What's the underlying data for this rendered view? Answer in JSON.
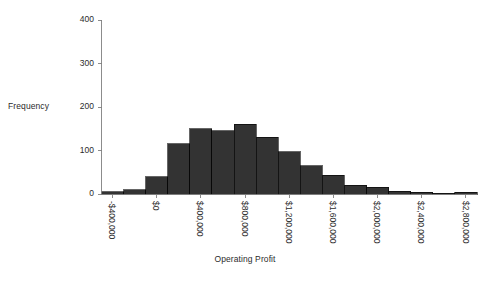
{
  "chart_data": {
    "type": "bar",
    "title": "",
    "xlabel": "Operating Profit",
    "ylabel": "Frequency",
    "bin_width": 200000,
    "x_start": -500000,
    "xlim": [
      -500000,
      2900000
    ],
    "ylim": [
      0,
      400
    ],
    "grid": false,
    "legend": null,
    "bar_color": "#333333",
    "axis_color": "#808080",
    "categories": [
      "-$500,000 to -$300,000",
      "-$300,000 to -$100,000",
      "-$100,000 to $100,000",
      "$100,000 to $300,000",
      "$300,000 to $500,000",
      "$500,000 to $700,000",
      "$700,000 to $900,000",
      "$900,000 to $1,100,000",
      "$1,100,000 to $1,300,000",
      "$1,300,000 to $1,500,000",
      "$1,500,000 to $1,700,000",
      "$1,700,000 to $1,900,000",
      "$1,900,000 to $2,100,000",
      "$2,100,000 to $2,300,000",
      "$2,300,000 to $2,500,000",
      "$2,500,000 to $2,700,000",
      "$2,700,000 to $2,900,000"
    ],
    "values": [
      5,
      10,
      40,
      115,
      150,
      145,
      160,
      130,
      97,
      65,
      43,
      20,
      15,
      6,
      4,
      2,
      4
    ],
    "ytick_labels": [
      "0",
      "100",
      "200",
      "300",
      "400"
    ],
    "ytick_values": [
      0,
      100,
      200,
      300,
      400
    ],
    "xtick_labels": [
      "-$400,000",
      "$0",
      "$400,000",
      "$800,000",
      "$1,200,000",
      "$1,600,000",
      "$2,000,000",
      "$2,400,000",
      "$2,800,000"
    ],
    "xtick_values": [
      -400000,
      0,
      400000,
      800000,
      1200000,
      1600000,
      2000000,
      2400000,
      2800000
    ]
  }
}
